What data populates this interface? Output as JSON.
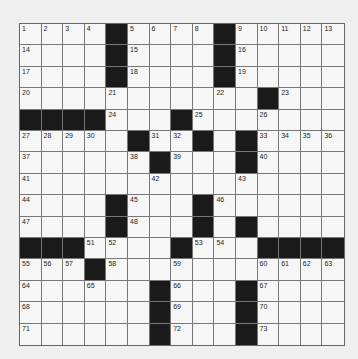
{
  "puzzle": {
    "rows": 15,
    "cols": 15,
    "grid": [
      "....#....#.....",
      "....#....#.....",
      "....#....#.....",
      "...........#...",
      "####...#.......",
      ".....#..#.#....",
      "......#...#....",
      "...............",
      "....#...#......",
      "....#...#.#....",
      "###....#...####",
      "...#...........",
      "......#...#....",
      "......#...#....",
      "......#...#...."
    ],
    "numbers": [
      {
        "n": "1",
        "r": 0,
        "c": 0
      },
      {
        "n": "2",
        "r": 0,
        "c": 1
      },
      {
        "n": "3",
        "r": 0,
        "c": 2
      },
      {
        "n": "4",
        "r": 0,
        "c": 3
      },
      {
        "n": "5",
        "r": 0,
        "c": 5
      },
      {
        "n": "6",
        "r": 0,
        "c": 6
      },
      {
        "n": "7",
        "r": 0,
        "c": 7
      },
      {
        "n": "8",
        "r": 0,
        "c": 8
      },
      {
        "n": "9",
        "r": 0,
        "c": 10
      },
      {
        "n": "10",
        "r": 0,
        "c": 11
      },
      {
        "n": "11",
        "r": 0,
        "c": 12
      },
      {
        "n": "12",
        "r": 0,
        "c": 13
      },
      {
        "n": "13",
        "r": 0,
        "c": 14
      },
      {
        "n": "14",
        "r": 1,
        "c": 0
      },
      {
        "n": "15",
        "r": 1,
        "c": 5
      },
      {
        "n": "16",
        "r": 1,
        "c": 10
      },
      {
        "n": "17",
        "r": 2,
        "c": 0
      },
      {
        "n": "18",
        "r": 2,
        "c": 5
      },
      {
        "n": "19",
        "r": 2,
        "c": 10
      },
      {
        "n": "20",
        "r": 3,
        "c": 0
      },
      {
        "n": "21",
        "r": 3,
        "c": 4
      },
      {
        "n": "22",
        "r": 3,
        "c": 9
      },
      {
        "n": "23",
        "r": 3,
        "c": 12
      },
      {
        "n": "24",
        "r": 4,
        "c": 4
      },
      {
        "n": "25",
        "r": 4,
        "c": 8
      },
      {
        "n": "26",
        "r": 4,
        "c": 11
      },
      {
        "n": "27",
        "r": 5,
        "c": 0
      },
      {
        "n": "28",
        "r": 5,
        "c": 1
      },
      {
        "n": "29",
        "r": 5,
        "c": 2
      },
      {
        "n": "30",
        "r": 5,
        "c": 3
      },
      {
        "n": "31",
        "r": 5,
        "c": 6
      },
      {
        "n": "32",
        "r": 5,
        "c": 7
      },
      {
        "n": "33",
        "r": 5,
        "c": 11
      },
      {
        "n": "34",
        "r": 5,
        "c": 12
      },
      {
        "n": "35",
        "r": 5,
        "c": 13
      },
      {
        "n": "36",
        "r": 5,
        "c": 14
      },
      {
        "n": "37",
        "r": 6,
        "c": 0
      },
      {
        "n": "38",
        "r": 6,
        "c": 5
      },
      {
        "n": "39",
        "r": 6,
        "c": 7
      },
      {
        "n": "40",
        "r": 6,
        "c": 11
      },
      {
        "n": "41",
        "r": 7,
        "c": 0
      },
      {
        "n": "42",
        "r": 7,
        "c": 6
      },
      {
        "n": "43",
        "r": 7,
        "c": 10
      },
      {
        "n": "44",
        "r": 8,
        "c": 0
      },
      {
        "n": "45",
        "r": 8,
        "c": 5
      },
      {
        "n": "46",
        "r": 8,
        "c": 9
      },
      {
        "n": "47",
        "r": 9,
        "c": 0
      },
      {
        "n": "48",
        "r": 9,
        "c": 5
      },
      {
        "n": "49",
        "r": 9,
        "c": 8
      },
      {
        "n": "50",
        "r": 9,
        "c": 10
      },
      {
        "n": "51",
        "r": 10,
        "c": 3
      },
      {
        "n": "52",
        "r": 10,
        "c": 4
      },
      {
        "n": "53",
        "r": 10,
        "c": 8
      },
      {
        "n": "54",
        "r": 10,
        "c": 9
      },
      {
        "n": "55",
        "r": 11,
        "c": 0
      },
      {
        "n": "56",
        "r": 11,
        "c": 1
      },
      {
        "n": "57",
        "r": 11,
        "c": 2
      },
      {
        "n": "58",
        "r": 11,
        "c": 4
      },
      {
        "n": "59",
        "r": 11,
        "c": 7
      },
      {
        "n": "60",
        "r": 11,
        "c": 11
      },
      {
        "n": "61",
        "r": 11,
        "c": 12
      },
      {
        "n": "62",
        "r": 11,
        "c": 13
      },
      {
        "n": "63",
        "r": 11,
        "c": 14
      },
      {
        "n": "64",
        "r": 12,
        "c": 0
      },
      {
        "n": "65",
        "r": 12,
        "c": 3
      },
      {
        "n": "66",
        "r": 12,
        "c": 7
      },
      {
        "n": "67",
        "r": 12,
        "c": 11
      },
      {
        "n": "68",
        "r": 13,
        "c": 0
      },
      {
        "n": "69",
        "r": 13,
        "c": 7
      },
      {
        "n": "70",
        "r": 13,
        "c": 11
      },
      {
        "n": "71",
        "r": 14,
        "c": 0
      },
      {
        "n": "72",
        "r": 14,
        "c": 7
      },
      {
        "n": "73",
        "r": 14,
        "c": 11
      }
    ]
  }
}
